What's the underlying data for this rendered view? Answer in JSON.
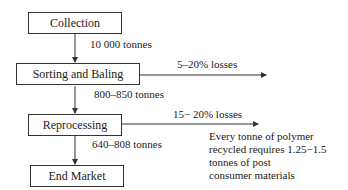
{
  "diagram": {
    "nodes": [
      {
        "id": "collection",
        "label": "Collection"
      },
      {
        "id": "sorting",
        "label": "Sorting and Baling"
      },
      {
        "id": "reprocessing",
        "label": "Reprocessing"
      },
      {
        "id": "end_market",
        "label": "End Market"
      }
    ],
    "flows": [
      {
        "from": "collection",
        "to": "sorting",
        "label": "10 000 tonnes"
      },
      {
        "from": "sorting",
        "to": "reprocessing",
        "label": "800–850 tonnes"
      },
      {
        "from": "reprocessing",
        "to": "end_market",
        "label": "640–808 tonnes"
      }
    ],
    "losses": [
      {
        "from": "sorting",
        "label": "5–20% losses"
      },
      {
        "from": "reprocessing",
        "label": "15− 20% losses"
      }
    ],
    "note": {
      "lines": [
        "Every tonne of polymer",
        "recycled requires 1.25−1.5",
        "tonnes of post",
        "consumer materials"
      ]
    }
  }
}
